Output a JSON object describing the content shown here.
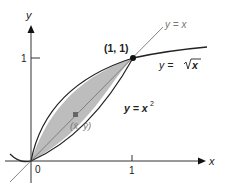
{
  "figure": {
    "axes": {
      "x_label": "x",
      "y_label": "y",
      "origin_label": "0",
      "x_tick_label": "1",
      "y_tick_label": "1"
    },
    "curves": {
      "line_label": "y = x",
      "sqrt_label_prefix": "y = ",
      "sqrt_label_radicand": "x",
      "square_label_prefix": "y = x",
      "square_label_exp": "2"
    },
    "points": {
      "intersection_label": "(1, 1)",
      "centroid_label": "(x̄, ȳ)"
    },
    "colors": {
      "region_fill": "#bdbdbd",
      "axis": "#333333",
      "curve": "#222222",
      "line": "#666666",
      "centroid": "#666666"
    }
  }
}
